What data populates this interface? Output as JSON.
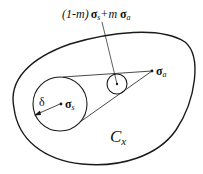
{
  "diagram": {
    "top_label": {
      "prefix": "(1-m)",
      "sigma_s": "σ",
      "sub_s": "s",
      "middle": "+m ",
      "sigma_a": "σ",
      "sub_a": "a"
    },
    "point_a_label": {
      "sigma": "σ",
      "sub": "a"
    },
    "point_s_label": {
      "sigma": "σ",
      "sub": "s"
    },
    "radius_label": "δ",
    "region_label": {
      "main": "C",
      "sub": "x"
    },
    "colors": {
      "stroke": "#1a1a1a",
      "background": "#ffffff"
    }
  }
}
